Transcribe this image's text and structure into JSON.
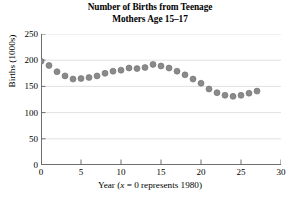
{
  "chart_data": {
    "type": "scatter",
    "title": "Number of Births from Teenage Mothers Age 15–17",
    "title_lines": [
      "Number of Births from Teenage",
      "Mothers Age 15–17"
    ],
    "xlabel_prefix": "Year (",
    "xlabel_italic": "x",
    "xlabel_suffix": " = 0 represents 1980)",
    "xlabel": "Year (x = 0 represents 1980)",
    "ylabel": "Births (1000s)",
    "xlim": [
      0,
      30
    ],
    "ylim": [
      0,
      250
    ],
    "xticks": [
      0,
      5,
      10,
      15,
      20,
      25,
      30
    ],
    "yticks": [
      0,
      50,
      100,
      150,
      200,
      250
    ],
    "xtick_labels": [
      "0",
      "5",
      "10",
      "15",
      "20",
      "25",
      "30"
    ],
    "ytick_labels": [
      "0",
      "50",
      "100",
      "150",
      "200",
      "250"
    ],
    "grid": "horizontal",
    "grid_color": "#d9d9d9",
    "marker_color": "#8a8a8a",
    "marker_edge_color": "#6f6f6f",
    "axis_color": "#6e6e6e",
    "marker_radius": 3.0,
    "x": [
      0,
      1,
      2,
      3,
      4,
      5,
      6,
      7,
      8,
      9,
      10,
      11,
      12,
      13,
      14,
      15,
      16,
      17,
      18,
      19,
      20,
      21,
      22,
      23,
      24,
      25,
      26,
      27
    ],
    "values": [
      198,
      190,
      178,
      170,
      164,
      165,
      167,
      170,
      175,
      179,
      181,
      185,
      184,
      186,
      192,
      189,
      185,
      179,
      172,
      164,
      156,
      145,
      138,
      133,
      131,
      133,
      137,
      141
    ],
    "series": [
      {
        "name": "Births from teenage mothers age 15–17",
        "values": [
          198,
          190,
          178,
          170,
          164,
          165,
          167,
          170,
          175,
          179,
          181,
          185,
          184,
          186,
          192,
          189,
          185,
          179,
          172,
          164,
          156,
          145,
          138,
          133,
          131,
          133,
          137,
          141
        ]
      }
    ],
    "legend": null,
    "legend_position": "none"
  }
}
